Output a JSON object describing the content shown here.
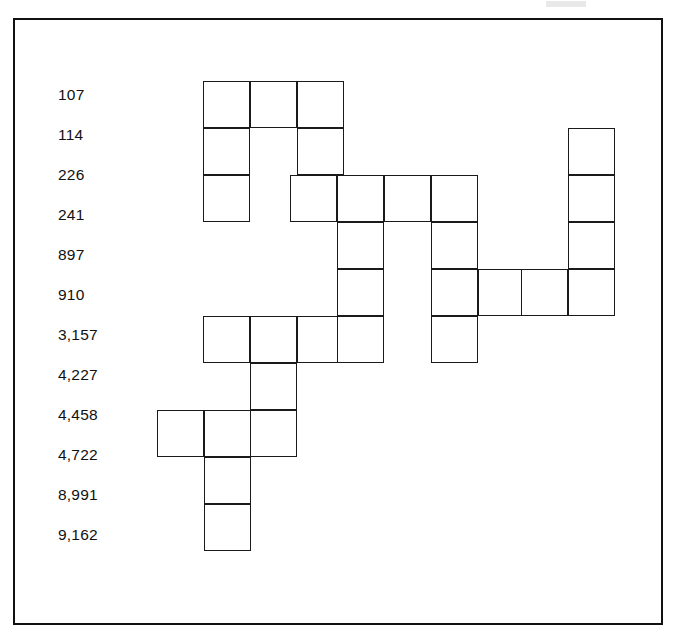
{
  "page": {
    "background_color": "#ffffff",
    "border_color": "#111111",
    "grid_line_color": "#1a1a1a",
    "text_color": "#111111"
  },
  "frame": {
    "name": "outer-border",
    "x": 13,
    "y": 18,
    "width": 650,
    "height": 607
  },
  "artifact": {
    "name": "top-grey-mark",
    "color": "#e9e9e9",
    "x": 546,
    "y": 1,
    "width": 40,
    "height": 6
  },
  "numbers": {
    "count": 12,
    "items": [
      {
        "value": "107",
        "y": 87
      },
      {
        "value": "114",
        "y": 127
      },
      {
        "value": "226",
        "y": 167
      },
      {
        "value": "241",
        "y": 207
      },
      {
        "value": "897",
        "y": 247
      },
      {
        "value": "910",
        "y": 287
      },
      {
        "value": "3,157",
        "y": 327
      },
      {
        "value": "4,227",
        "y": 367
      },
      {
        "value": "4,458",
        "y": 407
      },
      {
        "value": "4,722",
        "y": 447
      },
      {
        "value": "8,991",
        "y": 487
      },
      {
        "value": "9,162",
        "y": 527
      }
    ]
  },
  "grid": {
    "cell_size": 47,
    "origin_x": 203,
    "origin_y": 81,
    "rows": 10,
    "cell_count": 32,
    "cells": [
      {
        "row": 1,
        "col": 0,
        "x": 203,
        "y": 81
      },
      {
        "row": 1,
        "col": 1,
        "x": 250,
        "y": 81
      },
      {
        "row": 1,
        "col": 2,
        "x": 297,
        "y": 81
      },
      {
        "row": 2,
        "col": 0,
        "x": 203,
        "y": 128
      },
      {
        "row": 2,
        "col": 2,
        "x": 297,
        "y": 128
      },
      {
        "row": 2,
        "col": 8,
        "x": 568,
        "y": 128
      },
      {
        "row": 3,
        "col": 0,
        "x": 203,
        "y": 175
      },
      {
        "row": 3,
        "col": 2,
        "x": 290,
        "y": 175
      },
      {
        "row": 3,
        "col": 3,
        "x": 337,
        "y": 175
      },
      {
        "row": 3,
        "col": 4,
        "x": 384,
        "y": 175
      },
      {
        "row": 3,
        "col": 5,
        "x": 431,
        "y": 175
      },
      {
        "row": 3,
        "col": 8,
        "x": 568,
        "y": 175
      },
      {
        "row": 4,
        "col": 3,
        "x": 337,
        "y": 222
      },
      {
        "row": 4,
        "col": 5,
        "x": 431,
        "y": 222
      },
      {
        "row": 4,
        "col": 8,
        "x": 568,
        "y": 222
      },
      {
        "row": 5,
        "col": 3,
        "x": 337,
        "y": 269
      },
      {
        "row": 5,
        "col": 5,
        "x": 431,
        "y": 269
      },
      {
        "row": 5,
        "col": 6,
        "x": 478,
        "y": 269
      },
      {
        "row": 5,
        "col": 7,
        "x": 521,
        "y": 269
      },
      {
        "row": 5,
        "col": 8,
        "x": 568,
        "y": 269
      },
      {
        "row": 6,
        "col": 0,
        "x": 203,
        "y": 316
      },
      {
        "row": 6,
        "col": 1,
        "x": 250,
        "y": 316
      },
      {
        "row": 6,
        "col": 2,
        "x": 297,
        "y": 316
      },
      {
        "row": 6,
        "col": 3,
        "x": 337,
        "y": 316
      },
      {
        "row": 6,
        "col": 5,
        "x": 431,
        "y": 316
      },
      {
        "row": 7,
        "col": 1,
        "x": 250,
        "y": 363
      },
      {
        "row": 8,
        "col": -1,
        "x": 157,
        "y": 410
      },
      {
        "row": 8,
        "col": 0,
        "x": 204,
        "y": 410
      },
      {
        "row": 8,
        "col": 1,
        "x": 250,
        "y": 410
      },
      {
        "row": 9,
        "col": 0,
        "x": 204,
        "y": 457
      },
      {
        "row": 10,
        "col": 0,
        "x": 204,
        "y": 504
      }
    ]
  }
}
